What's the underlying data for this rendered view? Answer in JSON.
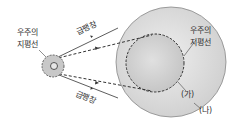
{
  "labels": {
    "horizon_left_line1": "우주의",
    "horizon_left_line2": "지평선",
    "horizon_right_line1": "우주의",
    "horizon_right_line2": "지평선",
    "inflation_top": "급팽창",
    "inflation_bottom": "급팽창",
    "inner_sphere": "(가)",
    "outer_sphere": "(나)"
  },
  "colors": {
    "sphere_fill": "#d4d4d4",
    "small_fill": "#bdbdbd",
    "line": "#333333"
  }
}
